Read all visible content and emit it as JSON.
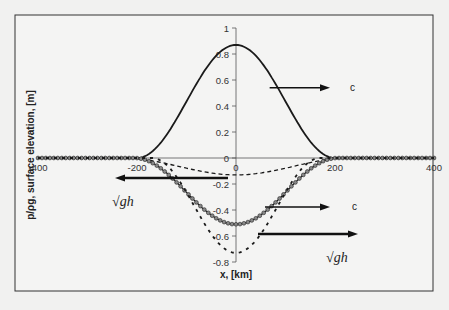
{
  "chart_data": {
    "type": "line",
    "title": "",
    "xlabel": "x,  [km]",
    "ylabel": "p/ρg, surface elevation, [m]",
    "xlim": [
      -400,
      400
    ],
    "ylim": [
      -0.8,
      1.0
    ],
    "x_ticks": [
      -400,
      -200,
      0,
      200,
      400
    ],
    "x_tick_labels": [
      "-400",
      "-200",
      "0",
      "200",
      "400"
    ],
    "y_ticks": [
      1,
      0.8,
      0.6,
      0.4,
      0.2,
      0,
      -0.2,
      -0.4,
      -0.6,
      -0.8
    ],
    "y_tick_labels": [
      "1",
      "0.8",
      "0.6",
      "0.4",
      "0.2",
      "0",
      "-0.2",
      "-0.4",
      "-0.6",
      "-0.8"
    ],
    "grid": false,
    "legend": null,
    "series": [
      {
        "name": "pressure disturbance p/ρg",
        "style": "solid",
        "shape": "cos2",
        "peak_x": 0,
        "peak_y": 0.87,
        "half_width": 200,
        "x": [
          -400,
          -200,
          -150,
          -100,
          -50,
          0,
          50,
          100,
          150,
          200,
          400
        ],
        "y": [
          0,
          0,
          0.13,
          0.44,
          0.74,
          0.87,
          0.74,
          0.44,
          0.13,
          0,
          0
        ]
      },
      {
        "name": "surface elevation (small, dashed)",
        "style": "dashed",
        "shape": "cos2",
        "peak_x": 0,
        "peak_y": -0.13,
        "half_width": 230,
        "x": [
          -400,
          -230,
          -150,
          -100,
          -50,
          0,
          50,
          100,
          150,
          230,
          400
        ],
        "y": [
          0,
          0,
          -0.04,
          -0.08,
          -0.11,
          -0.13,
          -0.11,
          -0.08,
          -0.04,
          0,
          0
        ]
      },
      {
        "name": "surface elevation (markers)",
        "style": "solid-with-markers",
        "shape": "cos2",
        "peak_x": 0,
        "peak_y": -0.51,
        "half_width": 205,
        "x": [
          -400,
          -205,
          -150,
          -100,
          -50,
          0,
          50,
          100,
          150,
          205,
          400
        ],
        "y": [
          0,
          0,
          -0.07,
          -0.25,
          -0.44,
          -0.51,
          -0.44,
          -0.25,
          -0.07,
          0,
          0
        ]
      },
      {
        "name": "surface elevation (resonant, dotted)",
        "style": "dotted",
        "shape": "cos2",
        "peak_x": 0,
        "peak_y": -0.73,
        "half_width": 170,
        "x": [
          -400,
          -170,
          -120,
          -80,
          -40,
          0,
          40,
          80,
          120,
          170,
          400
        ],
        "y": [
          0,
          0,
          -0.12,
          -0.37,
          -0.64,
          -0.73,
          -0.64,
          -0.37,
          -0.12,
          0,
          0
        ]
      }
    ],
    "annotations": [
      {
        "label": "c",
        "arrow_direction": "right",
        "y_level": 0.54,
        "from_x": 68,
        "to_x": 190
      },
      {
        "label": "√gh",
        "arrow_direction": "left",
        "y_level": -0.15,
        "from_x": -15,
        "to_x": -245
      },
      {
        "label": "c",
        "arrow_direction": "right",
        "y_level": -0.37,
        "from_x": 58,
        "to_x": 190
      },
      {
        "label": "√gh",
        "arrow_direction": "right",
        "y_level": -0.58,
        "from_x": 45,
        "to_x": 245
      }
    ]
  },
  "labels": {
    "ylabel": "p/ρg, surface elevation, [m]",
    "xlabel": "x,  [km]",
    "c_upper": "c",
    "c_lower": "c",
    "sqrt_gh": "√gh"
  }
}
